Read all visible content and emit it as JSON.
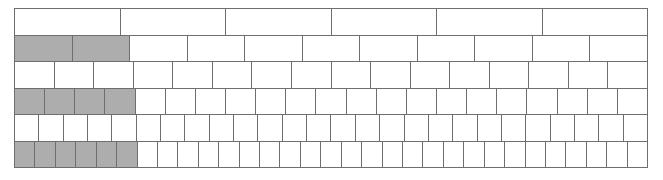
{
  "figure": {
    "kind": "fraction-wall",
    "title": "",
    "border_color": "#6e6e6e",
    "cell_fill": "#ffffff",
    "shaded_fill": "#adadad",
    "background": "#ffffff",
    "width_px": 634,
    "height_px": 160,
    "left_px": 14,
    "top_px": 8
  },
  "chart_data": {
    "type": "bar",
    "title": "",
    "xlabel": "",
    "ylabel": "",
    "grid": false,
    "legend": "none",
    "categories": [
      "row-1",
      "row-2",
      "row-3",
      "row-4",
      "row-5",
      "row-6"
    ],
    "series": [
      {
        "name": "cells_per_row",
        "values": [
          6,
          11,
          16,
          21,
          26,
          31
        ]
      },
      {
        "name": "shaded_cells",
        "values": [
          0,
          2,
          0,
          4,
          0,
          6
        ]
      },
      {
        "name": "shaded_fraction",
        "values": [
          0,
          0.1818,
          0,
          0.1905,
          0,
          0.1935
        ]
      }
    ],
    "annotations": []
  },
  "rows": [
    {
      "id": "row-1",
      "cells": 6,
      "shaded": 0,
      "label": "6 parts, 0 shaded"
    },
    {
      "id": "row-2",
      "cells": 11,
      "shaded": 2,
      "label": "11 parts, 2 shaded"
    },
    {
      "id": "row-3",
      "cells": 16,
      "shaded": 0,
      "label": "16 parts, 0 shaded"
    },
    {
      "id": "row-4",
      "cells": 21,
      "shaded": 4,
      "label": "21 parts, 4 shaded"
    },
    {
      "id": "row-5",
      "cells": 26,
      "shaded": 0,
      "label": "26 parts, 0 shaded"
    },
    {
      "id": "row-6",
      "cells": 31,
      "shaded": 6,
      "label": "31 parts, 6 shaded"
    }
  ]
}
